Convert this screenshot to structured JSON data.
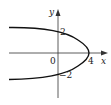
{
  "diagram": {
    "type": "parabola-graph",
    "equation": "x = 4 - y^2",
    "axes": {
      "x_label": "x",
      "y_label": "y"
    },
    "labels": {
      "origin": "0",
      "x_intercept": "4",
      "y_intercept_top": "2",
      "y_intercept_bottom": "−2"
    },
    "points": {
      "vertex": [
        4,
        0
      ],
      "y_intercepts": [
        [
          0,
          2
        ],
        [
          0,
          -2
        ]
      ]
    },
    "colors": {
      "curve": "#111111",
      "axes": "#333333"
    }
  }
}
